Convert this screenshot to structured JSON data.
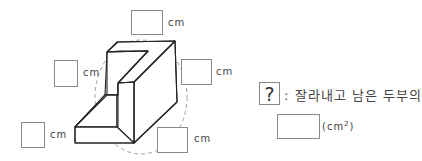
{
  "diagram": {
    "type": "3d-solid-tofu-cut",
    "inputs": [
      {
        "id": "top",
        "unit": "cm"
      },
      {
        "id": "left-middle",
        "unit": "cm"
      },
      {
        "id": "right",
        "unit": "cm"
      },
      {
        "id": "bottom-left",
        "unit": "cm"
      },
      {
        "id": "bottom-right",
        "unit": "cm"
      }
    ],
    "question": {
      "symbol": "?",
      "text": ": 잘라내고 남은 두부의",
      "answer_unit_open": "(cm",
      "answer_unit_sup": "2",
      "answer_unit_close": ")"
    }
  }
}
